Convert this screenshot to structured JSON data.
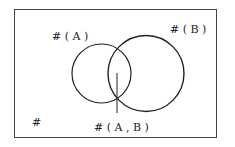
{
  "diagram": {
    "type": "venn",
    "labels": {
      "a": "# ( A )",
      "b": "# ( B )",
      "ab": "# ( A , B )",
      "universe": "#"
    },
    "colors": {
      "stroke": "#222222",
      "background": "#ffffff"
    }
  }
}
